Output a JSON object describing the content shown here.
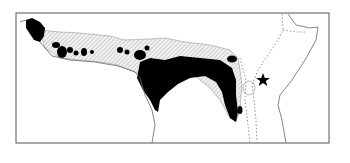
{
  "map": {
    "region": "Tropical Africa",
    "frame": {
      "x": 16,
      "y": 13,
      "width": 313,
      "height": 59,
      "stroke": "#444444"
    },
    "legend_items": [
      {
        "name": "core-range",
        "fill": "#000000",
        "style": "solid"
      },
      {
        "name": "secondary-range",
        "fill": "#bbbbbb",
        "style": "hatched"
      },
      {
        "name": "boundary",
        "stroke": "#888888",
        "style": "dotted"
      }
    ],
    "marker": {
      "icon": "star-icon",
      "x": 263,
      "y": 80,
      "color": "#000000"
    },
    "colors": {
      "coastline": "#555555",
      "core_fill": "#000000",
      "hatch": "#aaaaaa",
      "background": "#ffffff"
    }
  }
}
